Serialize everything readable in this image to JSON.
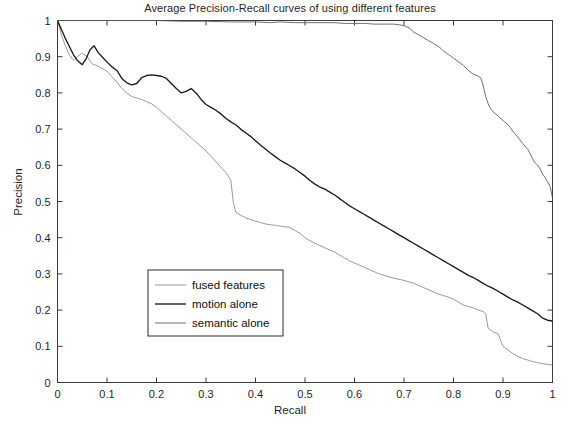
{
  "chart_data": {
    "type": "line",
    "title": "Average Precision-Recall curves of using different features",
    "xlabel": "Recall",
    "ylabel": "Precision",
    "xlim": [
      0,
      1
    ],
    "ylim": [
      0,
      1
    ],
    "grid": false,
    "legend_position": "center-left",
    "xticks": [
      "0",
      "0.1",
      "0.2",
      "0.3",
      "0.4",
      "0.5",
      "0.6",
      "0.7",
      "0.8",
      "0.9",
      "1"
    ],
    "yticks": [
      "0",
      "0.1",
      "0.2",
      "0.3",
      "0.4",
      "0.5",
      "0.6",
      "0.7",
      "0.8",
      "0.9",
      "1"
    ],
    "xtick_values": [
      0,
      0.1,
      0.2,
      0.3,
      0.4,
      0.5,
      0.6,
      0.7,
      0.8,
      0.9,
      1
    ],
    "ytick_values": [
      0,
      0.1,
      0.2,
      0.3,
      0.4,
      0.5,
      0.6,
      0.7,
      0.8,
      0.9,
      1
    ],
    "series": [
      {
        "name": "fused features",
        "color": "#9a9a9a",
        "width": 1.0,
        "x": [
          0.0,
          0.008,
          0.016,
          0.024,
          0.032,
          0.04,
          0.05,
          0.06,
          0.07,
          0.08,
          0.09,
          0.1,
          0.11,
          0.12,
          0.13,
          0.14,
          0.15,
          0.16,
          0.17,
          0.18,
          0.19,
          0.2,
          0.21,
          0.22,
          0.23,
          0.24,
          0.25,
          0.26,
          0.27,
          0.28,
          0.29,
          0.3,
          0.31,
          0.32,
          0.33,
          0.34,
          0.35,
          0.355,
          0.36,
          0.37,
          0.38,
          0.39,
          0.4,
          0.41,
          0.42,
          0.43,
          0.44,
          0.45,
          0.46,
          0.47,
          0.48,
          0.49,
          0.5,
          0.51,
          0.52,
          0.53,
          0.54,
          0.55,
          0.56,
          0.57,
          0.58,
          0.59,
          0.6,
          0.61,
          0.62,
          0.63,
          0.64,
          0.65,
          0.66,
          0.67,
          0.68,
          0.69,
          0.7,
          0.71,
          0.72,
          0.73,
          0.74,
          0.75,
          0.76,
          0.77,
          0.78,
          0.79,
          0.8,
          0.81,
          0.82,
          0.83,
          0.84,
          0.85,
          0.86,
          0.865,
          0.87,
          0.88,
          0.89,
          0.9,
          0.91,
          0.92,
          0.93,
          0.94,
          0.95,
          0.96,
          0.97,
          0.98,
          0.99,
          1.0
        ],
        "y": [
          1.0,
          0.96,
          0.93,
          0.905,
          0.89,
          0.9,
          0.91,
          0.9,
          0.88,
          0.875,
          0.868,
          0.86,
          0.845,
          0.83,
          0.812,
          0.8,
          0.79,
          0.786,
          0.782,
          0.776,
          0.77,
          0.76,
          0.748,
          0.736,
          0.724,
          0.712,
          0.7,
          0.688,
          0.676,
          0.664,
          0.652,
          0.64,
          0.625,
          0.61,
          0.595,
          0.58,
          0.56,
          0.5,
          0.47,
          0.462,
          0.455,
          0.45,
          0.446,
          0.442,
          0.438,
          0.436,
          0.434,
          0.432,
          0.43,
          0.428,
          0.42,
          0.412,
          0.4,
          0.392,
          0.385,
          0.378,
          0.372,
          0.366,
          0.36,
          0.352,
          0.344,
          0.336,
          0.33,
          0.324,
          0.318,
          0.312,
          0.306,
          0.3,
          0.296,
          0.292,
          0.288,
          0.285,
          0.282,
          0.278,
          0.274,
          0.268,
          0.262,
          0.256,
          0.25,
          0.244,
          0.24,
          0.236,
          0.23,
          0.222,
          0.214,
          0.21,
          0.206,
          0.2,
          0.196,
          0.19,
          0.15,
          0.14,
          0.135,
          0.1,
          0.09,
          0.08,
          0.072,
          0.066,
          0.062,
          0.058,
          0.055,
          0.052,
          0.05,
          0.048
        ]
      },
      {
        "name": "motion alone",
        "color": "#1c1c1c",
        "width": 1.35,
        "x": [
          0.0,
          0.008,
          0.016,
          0.024,
          0.032,
          0.04,
          0.05,
          0.058,
          0.066,
          0.074,
          0.082,
          0.09,
          0.1,
          0.11,
          0.12,
          0.13,
          0.14,
          0.15,
          0.16,
          0.17,
          0.18,
          0.19,
          0.2,
          0.21,
          0.22,
          0.23,
          0.24,
          0.25,
          0.26,
          0.27,
          0.28,
          0.29,
          0.3,
          0.31,
          0.32,
          0.33,
          0.34,
          0.35,
          0.36,
          0.37,
          0.38,
          0.39,
          0.4,
          0.41,
          0.42,
          0.43,
          0.44,
          0.45,
          0.46,
          0.47,
          0.48,
          0.49,
          0.5,
          0.51,
          0.52,
          0.53,
          0.54,
          0.55,
          0.56,
          0.57,
          0.58,
          0.59,
          0.6,
          0.61,
          0.62,
          0.63,
          0.64,
          0.65,
          0.66,
          0.67,
          0.68,
          0.69,
          0.7,
          0.71,
          0.72,
          0.73,
          0.74,
          0.75,
          0.76,
          0.77,
          0.78,
          0.79,
          0.8,
          0.81,
          0.82,
          0.83,
          0.84,
          0.85,
          0.86,
          0.87,
          0.88,
          0.89,
          0.9,
          0.91,
          0.92,
          0.93,
          0.94,
          0.95,
          0.96,
          0.97,
          0.98,
          0.99,
          1.0
        ],
        "y": [
          1.0,
          0.975,
          0.95,
          0.928,
          0.906,
          0.89,
          0.878,
          0.895,
          0.92,
          0.93,
          0.912,
          0.9,
          0.885,
          0.872,
          0.862,
          0.84,
          0.828,
          0.822,
          0.826,
          0.842,
          0.848,
          0.85,
          0.848,
          0.846,
          0.84,
          0.826,
          0.812,
          0.8,
          0.804,
          0.812,
          0.8,
          0.782,
          0.768,
          0.76,
          0.752,
          0.742,
          0.73,
          0.72,
          0.712,
          0.7,
          0.69,
          0.68,
          0.668,
          0.656,
          0.645,
          0.634,
          0.624,
          0.614,
          0.606,
          0.598,
          0.59,
          0.58,
          0.57,
          0.558,
          0.548,
          0.54,
          0.534,
          0.526,
          0.518,
          0.508,
          0.498,
          0.488,
          0.48,
          0.472,
          0.464,
          0.456,
          0.448,
          0.44,
          0.432,
          0.424,
          0.416,
          0.408,
          0.4,
          0.392,
          0.384,
          0.376,
          0.368,
          0.36,
          0.352,
          0.344,
          0.336,
          0.328,
          0.32,
          0.312,
          0.304,
          0.296,
          0.29,
          0.282,
          0.274,
          0.266,
          0.26,
          0.252,
          0.244,
          0.236,
          0.228,
          0.222,
          0.214,
          0.206,
          0.198,
          0.19,
          0.178,
          0.172,
          0.17
        ]
      },
      {
        "name": "semantic alone",
        "color": "#6e6e6e",
        "width": 1.0,
        "x": [
          0.0,
          0.05,
          0.1,
          0.15,
          0.2,
          0.25,
          0.3,
          0.35,
          0.4,
          0.43,
          0.45,
          0.48,
          0.5,
          0.53,
          0.56,
          0.58,
          0.6,
          0.62,
          0.64,
          0.66,
          0.68,
          0.69,
          0.7,
          0.71,
          0.715,
          0.72,
          0.73,
          0.74,
          0.75,
          0.76,
          0.77,
          0.78,
          0.79,
          0.8,
          0.81,
          0.82,
          0.83,
          0.84,
          0.85,
          0.855,
          0.86,
          0.865,
          0.87,
          0.875,
          0.88,
          0.89,
          0.9,
          0.91,
          0.915,
          0.92,
          0.93,
          0.94,
          0.95,
          0.955,
          0.96,
          0.965,
          0.97,
          0.975,
          0.98,
          0.985,
          0.99,
          0.995,
          1.0
        ],
        "y": [
          1.0,
          1.0,
          1.0,
          1.0,
          1.0,
          0.998,
          0.998,
          0.996,
          0.996,
          0.994,
          0.996,
          0.994,
          0.994,
          0.994,
          0.994,
          0.992,
          0.992,
          0.992,
          0.99,
          0.99,
          0.99,
          0.988,
          0.986,
          0.98,
          0.974,
          0.968,
          0.96,
          0.952,
          0.944,
          0.936,
          0.928,
          0.916,
          0.906,
          0.896,
          0.886,
          0.876,
          0.862,
          0.852,
          0.846,
          0.842,
          0.82,
          0.79,
          0.77,
          0.756,
          0.748,
          0.736,
          0.724,
          0.712,
          0.704,
          0.694,
          0.678,
          0.66,
          0.644,
          0.632,
          0.618,
          0.606,
          0.6,
          0.59,
          0.576,
          0.566,
          0.554,
          0.542,
          0.51
        ]
      }
    ]
  },
  "legend": {
    "entries": [
      {
        "label": "fused features"
      },
      {
        "label": "motion alone"
      },
      {
        "label": "semantic alone"
      }
    ]
  }
}
